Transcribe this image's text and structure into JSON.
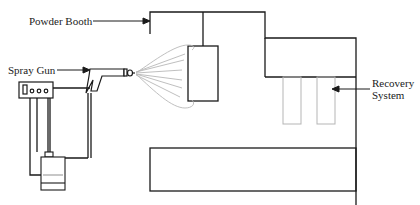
{
  "diagram": {
    "labels": {
      "powder_booth": "Powder Booth",
      "spray_gun": "Spray Gun",
      "recovery_line1": "Recovery",
      "recovery_line2": "System"
    },
    "components": [
      "powder-booth",
      "spray-gun",
      "spray-cone",
      "workpiece",
      "recovery-system",
      "control-unit",
      "powder-hopper",
      "base-platform"
    ],
    "colors": {
      "line": "#1a1a1a",
      "light_line": "#b5b5b5"
    }
  }
}
